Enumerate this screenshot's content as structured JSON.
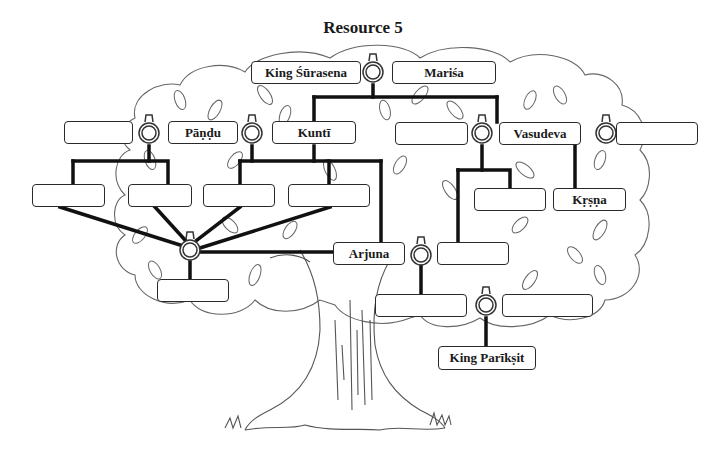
{
  "title": "Resource 5",
  "colors": {
    "line": "#111111",
    "outline": "#555555",
    "box_border": "#2a2a2a",
    "background": "#ffffff"
  },
  "icons": {
    "ring": "wedding-ring-icon",
    "leaf": "leaf-icon",
    "tree": "tree-icon"
  },
  "nodes": {
    "king_surasena": {
      "label": "King Śūrasena"
    },
    "marisa": {
      "label": "Mariśa"
    },
    "pandu_spouse": {
      "label": ""
    },
    "pandu": {
      "label": "Pāṇḍu"
    },
    "kunti": {
      "label": "Kuntī"
    },
    "vasudeva_spouse_left": {
      "label": ""
    },
    "vasudeva": {
      "label": "Vasudeva"
    },
    "vasudeva_spouse_right": {
      "label": ""
    },
    "pandava_1": {
      "label": ""
    },
    "pandava_2": {
      "label": ""
    },
    "pandava_3": {
      "label": ""
    },
    "pandava_4": {
      "label": ""
    },
    "vasudeva_child": {
      "label": ""
    },
    "krsna": {
      "label": "Kṛṣṇa"
    },
    "arjuna": {
      "label": "Arjuna"
    },
    "draupadi_child": {
      "label": ""
    },
    "arjuna_spouse": {
      "label": ""
    },
    "abhimanyu": {
      "label": ""
    },
    "abhimanyu_spouse": {
      "label": ""
    },
    "king_pariksit": {
      "label": "King Parīkṣit"
    }
  }
}
